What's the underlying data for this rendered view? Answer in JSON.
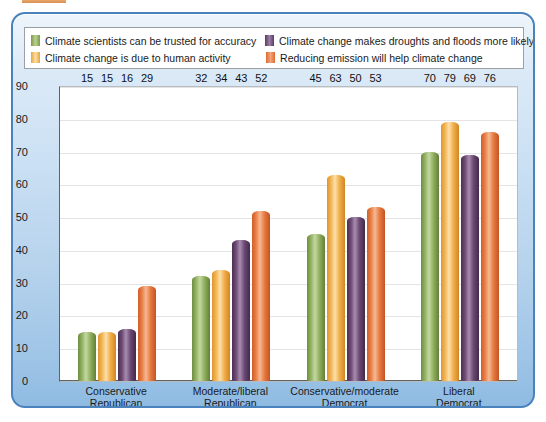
{
  "chart_data": {
    "type": "bar",
    "title": "",
    "xlabel": "",
    "ylabel": "",
    "ylim": [
      0,
      90
    ],
    "ytick_step": 10,
    "yticks": [
      90,
      80,
      70,
      60,
      50,
      40,
      30,
      20,
      10,
      0
    ],
    "grid": true,
    "legend_position": "top",
    "categories": [
      "Conservative\nRepublican",
      "Moderate/liberal\nRepublican",
      "Conservative/moderate\nDemocrat",
      "Liberal\nDemocrat"
    ],
    "category_lines": [
      [
        "Conservative",
        "Republican"
      ],
      [
        "Moderate/liberal",
        "Republican"
      ],
      [
        "Conservative/moderate",
        "Democrat"
      ],
      [
        "Liberal",
        "Democrat"
      ]
    ],
    "series": [
      {
        "name": "Climate scientists can be trusted for accuracy",
        "color": "#8FAF5E",
        "swatch": "sw-green",
        "bar": "b-green",
        "values": [
          15,
          32,
          45,
          70
        ]
      },
      {
        "name": "Climate change is due to human activity",
        "color": "#F0B055",
        "swatch": "sw-yellow",
        "bar": "b-yellow",
        "values": [
          15,
          34,
          63,
          79
        ]
      },
      {
        "name": "Climate change makes droughts and floods more likely",
        "color": "#6A4772",
        "swatch": "sw-purple",
        "bar": "b-purple",
        "values": [
          16,
          43,
          50,
          69
        ]
      },
      {
        "name": "Reducing emission will help climate change",
        "color": "#E5793E",
        "swatch": "sw-orange",
        "bar": "b-orange",
        "values": [
          29,
          52,
          53,
          76
        ]
      }
    ]
  },
  "legend": {
    "entries": [
      "Climate scientists can be trusted for accuracy",
      "Climate change makes droughts and floods more likely",
      "Climate change is due to human activity",
      "Reducing emission will help climate change"
    ]
  },
  "colors": {
    "panel_border": "#4a82bd",
    "plot_background": "#ffffff",
    "gridline": "#e2e4e6",
    "axis": "#5f6368"
  }
}
